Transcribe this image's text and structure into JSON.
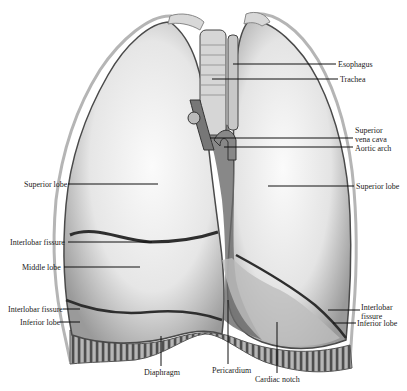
{
  "figure": {
    "colors": {
      "background": "#ffffff",
      "lung_fill": "#e8e8e8",
      "lung_highlight": "#f7f7f7",
      "lung_shadow": "#8a8a8a",
      "fissure": "#3a3a3a",
      "mediastinum": "#5a5a5a",
      "diaphragm": "#6e6e6e",
      "leader_line": "#111111",
      "label_text": "#1a1a1a"
    },
    "labels": [
      {
        "id": "esophagus",
        "text": "Esophagus",
        "side": "right",
        "x": 338,
        "y": 60,
        "line": [
          233,
          64,
          336,
          64
        ]
      },
      {
        "id": "trachea",
        "text": "Trachea",
        "side": "right",
        "x": 340,
        "y": 75,
        "line": [
          212,
          79,
          338,
          79
        ]
      },
      {
        "id": "superior-vena-cava",
        "text": "Superior\nvena cava",
        "side": "right",
        "x": 355,
        "y": 126,
        "line": [
          210,
          138,
          353,
          138
        ]
      },
      {
        "id": "aortic-arch",
        "text": "Aortic arch",
        "side": "right",
        "x": 355,
        "y": 144,
        "line": [
          224,
          147,
          353,
          147
        ]
      },
      {
        "id": "superior-lobe-right",
        "text": "Superior lobe",
        "side": "right",
        "x": 356,
        "y": 182,
        "line": [
          268,
          186,
          354,
          186
        ]
      },
      {
        "id": "superior-lobe-left",
        "text": "Superior lobe",
        "side": "left",
        "x": 24,
        "y": 180,
        "line": [
          68,
          184,
          158,
          184
        ]
      },
      {
        "id": "interlobar-fissure-left-upper",
        "text": "Interlobar fissure",
        "side": "left",
        "x": 10,
        "y": 238,
        "line": [
          68,
          242,
          152,
          242
        ]
      },
      {
        "id": "middle-lobe",
        "text": "Middle lobe",
        "side": "left",
        "x": 22,
        "y": 263,
        "line": [
          64,
          267,
          140,
          267
        ]
      },
      {
        "id": "interlobar-fissure-left-lower",
        "text": "Interlobar fissure",
        "side": "left",
        "x": 8,
        "y": 305,
        "line": [
          63,
          309,
          80,
          309
        ]
      },
      {
        "id": "inferior-lobe-left",
        "text": "Inferior lobe",
        "side": "left",
        "x": 20,
        "y": 318,
        "line": [
          60,
          322,
          80,
          322
        ]
      },
      {
        "id": "interlobar-fissure-right",
        "text": "Interlobar\nfissure",
        "side": "right",
        "x": 361,
        "y": 303,
        "line": [
          328,
          310,
          360,
          310
        ]
      },
      {
        "id": "inferior-lobe-right",
        "text": "Inferior lobe",
        "side": "right",
        "x": 357,
        "y": 319,
        "line": [
          333,
          323,
          356,
          323
        ]
      },
      {
        "id": "diaphragm",
        "text": "Diaphragm",
        "side": "bottom",
        "x": 144,
        "y": 368,
        "line": [
          161,
          336,
          161,
          366
        ]
      },
      {
        "id": "pericardium",
        "text": "Pericardium",
        "side": "bottom",
        "x": 212,
        "y": 366,
        "line": [
          228,
          300,
          228,
          364
        ]
      },
      {
        "id": "cardiac-notch",
        "text": "Cardiac notch",
        "side": "bottom",
        "x": 255,
        "y": 375,
        "line": [
          277,
          322,
          277,
          373
        ]
      }
    ]
  }
}
